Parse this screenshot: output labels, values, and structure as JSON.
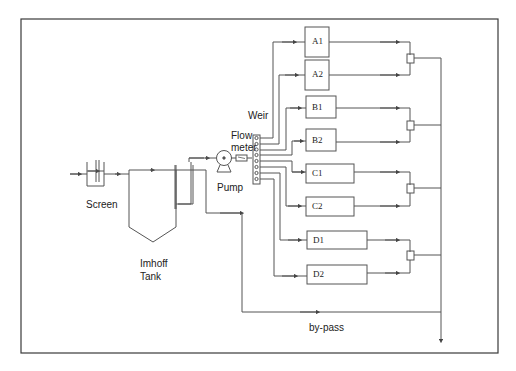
{
  "diagram": {
    "title": "",
    "labels": {
      "screen": "Screen",
      "imhoff_line1": "Imhoff",
      "imhoff_line2": "Tank",
      "pump": "Pump",
      "weir": "Weir",
      "flow_line1": "Flow",
      "flow_line2": "meter",
      "bypass": "by-pass"
    },
    "units": [
      {
        "id": "A1",
        "label": "A1"
      },
      {
        "id": "A2",
        "label": "A2"
      },
      {
        "id": "B1",
        "label": "B1"
      },
      {
        "id": "B2",
        "label": "B2"
      },
      {
        "id": "C1",
        "label": "C1"
      },
      {
        "id": "C2",
        "label": "C2"
      },
      {
        "id": "D1",
        "label": "D1"
      },
      {
        "id": "D2",
        "label": "D2"
      }
    ],
    "colors": {
      "line": "#555555",
      "frame": "#333333",
      "background": "#ffffff"
    }
  }
}
